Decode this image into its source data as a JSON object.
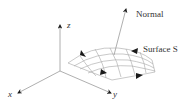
{
  "diagram": {
    "axes": {
      "x_label": "x",
      "y_label": "y",
      "z_label": "z"
    },
    "normal_label": "Normal",
    "surface_label": "Surface S",
    "colors": {
      "line": "#9a9a9a",
      "arrow": "#1a1a1a",
      "text": "#333333"
    }
  }
}
